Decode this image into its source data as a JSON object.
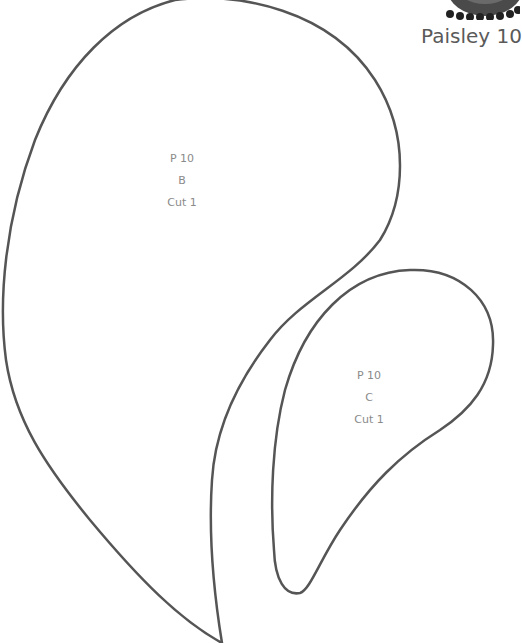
{
  "header": {
    "title": "Paisley 10",
    "thumbnail_icon": "paisley-flower-thumbnail-icon"
  },
  "pieces": [
    {
      "id": "B",
      "lines": [
        "P 10",
        "B",
        "Cut 1"
      ]
    },
    {
      "id": "C",
      "lines": [
        "P 10",
        "C",
        "Cut 1"
      ]
    }
  ],
  "colors": {
    "outline": "#555555",
    "label_text": "#8a8a8a",
    "title_text": "#5a5a5a",
    "background": "#ffffff"
  }
}
